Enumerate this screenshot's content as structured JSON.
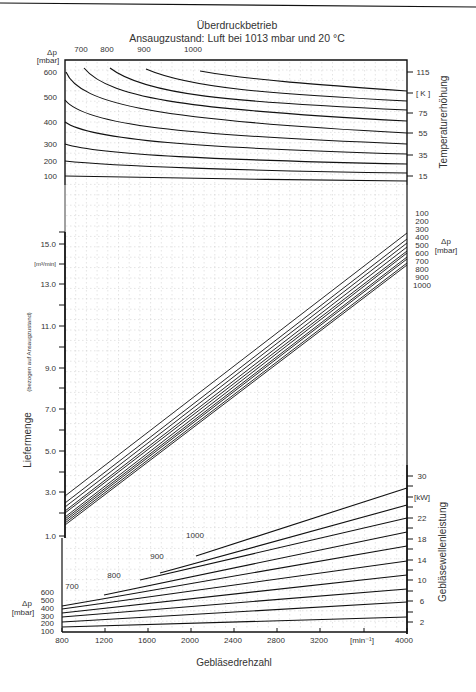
{
  "header": {
    "title": "Überdruckbetrieb",
    "subtitle": "Ansaugzustand: Luft bei 1013 mbar und 20 °C"
  },
  "top_panel": {
    "left_axis_label": "Δp",
    "left_axis_unit": "[mbar]",
    "left_ticks": [
      "600",
      "500",
      "400",
      "300",
      "200",
      "100"
    ],
    "top_curve_labels": [
      "700",
      "800",
      "900",
      "1000"
    ],
    "right_ticks": [
      "115",
      "[ K ]",
      "75",
      "55",
      "35",
      "15"
    ],
    "right_axis_label": "Temperaturerhöhung"
  },
  "middle_panel": {
    "left_axis_label": "Liefermenge",
    "left_axis_sublabel": "(bezogen auf Ansaugzustand)",
    "left_axis_unit": "[m³/min]",
    "left_ticks": [
      "15.0",
      "13.0",
      "11.0",
      "9.0",
      "7.0",
      "5.0",
      "3.0",
      "1.0"
    ],
    "right_legend_values": [
      "100",
      "200",
      "300",
      "400",
      "500",
      "600",
      "700",
      "800",
      "900",
      "1000"
    ],
    "right_legend_label": "Δp",
    "right_legend_unit": "[mbar]"
  },
  "bottom_panel": {
    "left_axis_label": "Δp",
    "left_axis_unit": "[mbar]",
    "left_ticks": [
      "600",
      "500",
      "400",
      "300",
      "200",
      "100"
    ],
    "curve_labels": [
      "700",
      "800",
      "900",
      "1000"
    ],
    "right_ticks": [
      "30",
      "[kW]",
      "22",
      "18",
      "14",
      "10",
      "6",
      "2"
    ],
    "right_axis_label": "Gebläsewellenleistung",
    "x_ticks": [
      "800",
      "1200",
      "1600",
      "2000",
      "2400",
      "2800",
      "3200",
      "[min⁻¹]",
      "4000"
    ],
    "x_axis_label": "Gebläsedrehzahl"
  },
  "chart_data": [
    {
      "type": "line",
      "title": "Temperaturerhöhung vs. Gebläsedrehzahl (Überdruckbetrieb)",
      "xlabel": "Gebläsedrehzahl [min⁻¹]",
      "ylabel": "Temperaturerhöhung [K]",
      "xlim": [
        800,
        4000
      ],
      "ylim": [
        5,
        125
      ],
      "grid": true,
      "x": [
        800,
        1200,
        1600,
        2000,
        2400,
        2800,
        3200,
        3600,
        4000
      ],
      "series": [
        {
          "name": "Δp 100 mbar",
          "values": [
            15,
            14.5,
            14,
            13.5,
            13,
            12.8,
            12.5,
            12.3,
            12
          ]
        },
        {
          "name": "Δp 200 mbar",
          "values": [
            33,
            30,
            28,
            27,
            26,
            25.5,
            25,
            24.5,
            24
          ]
        },
        {
          "name": "Δp 300 mbar",
          "values": [
            54,
            46,
            42,
            40,
            38,
            37,
            36.5,
            36,
            35
          ]
        },
        {
          "name": "Δp 400 mbar",
          "values": [
            79,
            64,
            57,
            53,
            51,
            49,
            48,
            47,
            46
          ]
        },
        {
          "name": "Δp 500 mbar",
          "values": [
            112,
            82,
            72,
            67,
            63,
            61,
            59,
            58,
            57
          ]
        },
        {
          "name": "Δp 600 mbar",
          "values": [
            null,
            103,
            88,
            80,
            76,
            73,
            71,
            69,
            68
          ]
        },
        {
          "name": "Δp 700 mbar",
          "values": [
            null,
            null,
            104,
            94,
            89,
            85,
            83,
            81,
            79
          ]
        },
        {
          "name": "Δp 800 mbar",
          "values": [
            null,
            null,
            120,
            108,
            101,
            97,
            94,
            92,
            90
          ]
        },
        {
          "name": "Δp 900 mbar",
          "values": [
            null,
            null,
            null,
            118,
            114,
            110,
            106,
            104,
            101
          ]
        },
        {
          "name": "Δp 1000 mbar",
          "values": [
            null,
            null,
            null,
            null,
            116,
            114,
            112,
            110,
            108
          ]
        }
      ]
    },
    {
      "type": "line",
      "title": "Liefermenge vs. Gebläsedrehzahl",
      "xlabel": "Gebläsedrehzahl [min⁻¹]",
      "ylabel": "Liefermenge (bezogen auf Ansaugzustand) [m³/min]",
      "xlim": [
        800,
        4000
      ],
      "ylim": [
        1.0,
        16.0
      ],
      "grid": true,
      "x": [
        800,
        4000
      ],
      "series": [
        {
          "name": "Δp 100 mbar",
          "values": [
            2.6,
            15.2
          ]
        },
        {
          "name": "Δp 200 mbar",
          "values": [
            2.3,
            14.9
          ]
        },
        {
          "name": "Δp 300 mbar",
          "values": [
            2.1,
            14.7
          ]
        },
        {
          "name": "Δp 400 mbar",
          "values": [
            1.9,
            14.5
          ]
        },
        {
          "name": "Δp 500 mbar",
          "values": [
            1.8,
            14.3
          ]
        },
        {
          "name": "Δp 600 mbar",
          "values": [
            1.6,
            14.2
          ]
        },
        {
          "name": "Δp 700 mbar",
          "values": [
            1.5,
            14.0
          ]
        },
        {
          "name": "Δp 800 mbar",
          "values": [
            1.4,
            13.9
          ]
        },
        {
          "name": "Δp 900 mbar",
          "values": [
            1.3,
            13.7
          ]
        },
        {
          "name": "Δp 1000 mbar",
          "values": [
            1.2,
            13.6
          ]
        }
      ]
    },
    {
      "type": "line",
      "title": "Gebläsewellenleistung vs. Gebläsedrehzahl",
      "xlabel": "Gebläsedrehzahl [min⁻¹]",
      "ylabel": "Gebläsewellenleistung [kW]",
      "xlim": [
        800,
        4000
      ],
      "ylim": [
        0,
        32
      ],
      "grid": true,
      "x": [
        800,
        4000
      ],
      "series": [
        {
          "name": "Δp 100 mbar",
          "values": [
            0.8,
            3.5
          ]
        },
        {
          "name": "Δp 200 mbar",
          "values": [
            1.6,
            6.4
          ]
        },
        {
          "name": "Δp 300 mbar",
          "values": [
            2.4,
            9.6
          ]
        },
        {
          "name": "Δp 400 mbar",
          "values": [
            3.3,
            12.5
          ]
        },
        {
          "name": "Δp 500 mbar",
          "values": [
            4.1,
            15.5
          ]
        },
        {
          "name": "Δp 600 mbar",
          "values": [
            5.0,
            18.5
          ]
        },
        {
          "name": "Δp 700 mbar",
          "values": [
            null,
            21.5
          ]
        },
        {
          "name": "Δp 800 mbar",
          "values": [
            null,
            24.5
          ]
        },
        {
          "name": "Δp 900 mbar",
          "values": [
            null,
            27.0
          ]
        },
        {
          "name": "Δp 1000 mbar",
          "values": [
            null,
            29.5
          ]
        }
      ],
      "series_start_rpm": {
        "700": 800,
        "800": 1200,
        "900": 1550,
        "1000": 2080
      }
    }
  ]
}
